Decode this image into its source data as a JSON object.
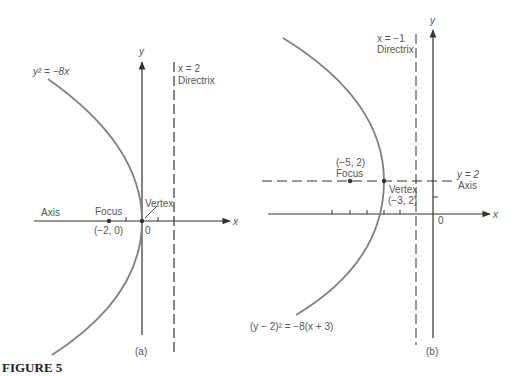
{
  "figure": {
    "caption": "FIGURE 5",
    "colors": {
      "curve": "#808080",
      "axis": "#333333",
      "text": "#555555"
    }
  },
  "panel_a": {
    "label": "(a)",
    "equation": "y² = −8x",
    "x_axis_label": "x",
    "y_axis_label": "y",
    "origin_label": "0",
    "directrix_eq": "x = 2",
    "directrix_label": "Directrix",
    "axis_label": "Axis",
    "focus_label": "Focus",
    "focus_coords": "(−2, 0)",
    "vertex_label": "Vertex"
  },
  "panel_b": {
    "label": "(b)",
    "equation": "(y − 2)² = −8(x + 3)",
    "x_axis_label": "x",
    "y_axis_label": "y",
    "origin_label": "0",
    "directrix_eq": "x = −1",
    "directrix_label": "Directrix",
    "axis_eq": "y = 2",
    "axis_label": "Axis",
    "focus_coords": "(−5, 2)",
    "focus_label": "Focus",
    "vertex_label": "Vertex",
    "vertex_coords": "(−3, 2)"
  }
}
